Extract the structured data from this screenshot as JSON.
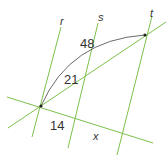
{
  "diagram": {
    "title": "",
    "colors": {
      "line": "#7cc04b",
      "arc": "#444444",
      "text": "#333333",
      "background": "#ffffff"
    },
    "parallel_lines": [
      {
        "name": "r",
        "label": "r"
      },
      {
        "name": "s",
        "label": "s"
      },
      {
        "name": "t",
        "label": "t"
      }
    ],
    "transversals": [
      {
        "name": "lower-transversal"
      },
      {
        "name": "upper-transversal"
      }
    ],
    "segment_labels": {
      "upper_rs": "21",
      "arc_length": "48",
      "lower_rs": "14",
      "lower_st": "x"
    }
  }
}
